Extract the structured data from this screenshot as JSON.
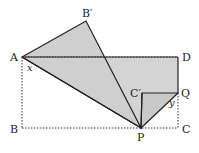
{
  "diagram": {
    "type": "geometry-folding",
    "points": {
      "A": {
        "label": "A",
        "x": 22,
        "y": 57
      },
      "B": {
        "label": "B",
        "x": 22,
        "y": 128
      },
      "C": {
        "label": "C",
        "x": 178,
        "y": 128
      },
      "D": {
        "label": "D",
        "x": 178,
        "y": 57
      },
      "B_prime": {
        "label": "B′",
        "x": 86,
        "y": 21
      },
      "C_prime": {
        "label": "C′",
        "x": 142,
        "y": 93
      },
      "P": {
        "label": "P",
        "x": 141,
        "y": 128
      },
      "Q": {
        "label": "Q",
        "x": 178,
        "y": 93
      }
    },
    "angles": {
      "x": {
        "label": "x",
        "at": "A"
      },
      "y": {
        "label": "y",
        "at": "Q"
      }
    },
    "colors": {
      "fill": "#d4d4d4",
      "stroke": "#222222",
      "dotted": "#333333"
    }
  }
}
